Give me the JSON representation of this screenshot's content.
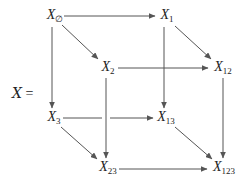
{
  "diagram": {
    "type": "commutative-cube",
    "lhs": {
      "symbol": "X",
      "equals": "="
    },
    "nodes": [
      {
        "id": "X_empty",
        "base": "X",
        "sub": "∅",
        "x": 55,
        "y": 16
      },
      {
        "id": "X_1",
        "base": "X",
        "sub": "1",
        "x": 167,
        "y": 16
      },
      {
        "id": "X_2",
        "base": "X",
        "sub": "2",
        "x": 108,
        "y": 68
      },
      {
        "id": "X_12",
        "base": "X",
        "sub": "12",
        "x": 223,
        "y": 68
      },
      {
        "id": "X_3",
        "base": "X",
        "sub": "3",
        "x": 54,
        "y": 118
      },
      {
        "id": "X_13",
        "base": "X",
        "sub": "13",
        "x": 166,
        "y": 118
      },
      {
        "id": "X_23",
        "base": "X",
        "sub": "23",
        "x": 108,
        "y": 168
      },
      {
        "id": "X_123",
        "base": "X",
        "sub": "123",
        "x": 224,
        "y": 168
      }
    ],
    "edges": [
      {
        "from": "X_empty",
        "to": "X_1"
      },
      {
        "from": "X_empty",
        "to": "X_2"
      },
      {
        "from": "X_empty",
        "to": "X_3"
      },
      {
        "from": "X_1",
        "to": "X_12"
      },
      {
        "from": "X_1",
        "to": "X_13"
      },
      {
        "from": "X_2",
        "to": "X_12"
      },
      {
        "from": "X_2",
        "to": "X_23"
      },
      {
        "from": "X_12",
        "to": "X_123"
      },
      {
        "from": "X_3",
        "to": "X_13"
      },
      {
        "from": "X_3",
        "to": "X_23"
      },
      {
        "from": "X_13",
        "to": "X_123"
      },
      {
        "from": "X_23",
        "to": "X_123"
      }
    ],
    "colors": {
      "stroke": "#555555",
      "text": "#222222"
    }
  }
}
